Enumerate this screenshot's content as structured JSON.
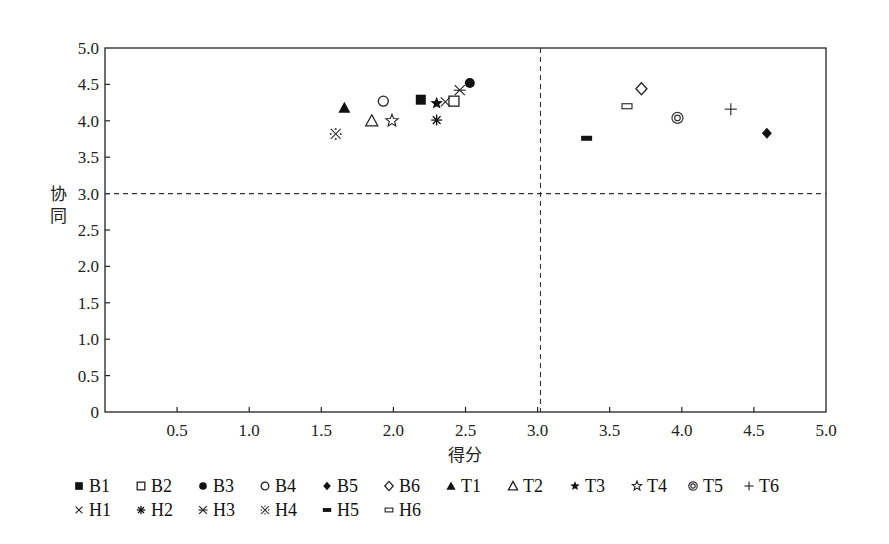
{
  "chart_data": {
    "type": "scatter",
    "title": "",
    "xlabel": "得分",
    "ylabel": "协同",
    "xlim": [
      0,
      5.0
    ],
    "ylim": [
      0,
      5.0
    ],
    "x_ticks": [
      "0.5",
      "1.0",
      "1.5",
      "2.0",
      "2.5",
      "3.0",
      "3.5",
      "4.0",
      "4.5",
      "5.0"
    ],
    "y_ticks": [
      "0",
      "0.5",
      "1.0",
      "1.5",
      "2.0",
      "2.5",
      "3.0",
      "3.5",
      "4.0",
      "4.5",
      "5.0"
    ],
    "grid": false,
    "reference_lines": [
      {
        "orientation": "vertical",
        "value": 3.02,
        "style": "dashed"
      },
      {
        "orientation": "horizontal",
        "value": 3.0,
        "style": "dashed"
      }
    ],
    "legend_position": "bottom",
    "series": [
      {
        "name": "B1",
        "marker": "filled-square",
        "x": 2.19,
        "y": 4.29
      },
      {
        "name": "B2",
        "marker": "open-square",
        "x": 2.42,
        "y": 4.27
      },
      {
        "name": "B3",
        "marker": "filled-circle",
        "x": 2.53,
        "y": 4.52
      },
      {
        "name": "B4",
        "marker": "open-circle",
        "x": 1.93,
        "y": 4.27
      },
      {
        "name": "B5",
        "marker": "filled-diamond",
        "x": 4.59,
        "y": 3.83
      },
      {
        "name": "B6",
        "marker": "open-diamond",
        "x": 3.72,
        "y": 4.44
      },
      {
        "name": "T1",
        "marker": "filled-triangle",
        "x": 1.66,
        "y": 4.18
      },
      {
        "name": "T2",
        "marker": "open-triangle",
        "x": 1.85,
        "y": 4.0
      },
      {
        "name": "T3",
        "marker": "filled-star",
        "x": 2.3,
        "y": 4.24
      },
      {
        "name": "T4",
        "marker": "open-star",
        "x": 1.99,
        "y": 4.0
      },
      {
        "name": "T5",
        "marker": "bullseye",
        "x": 3.97,
        "y": 4.04
      },
      {
        "name": "T6",
        "marker": "plus",
        "x": 4.34,
        "y": 4.16
      },
      {
        "name": "H1",
        "marker": "x-cross",
        "x": 2.36,
        "y": 4.26
      },
      {
        "name": "H2",
        "marker": "asterisk",
        "x": 2.3,
        "y": 4.01
      },
      {
        "name": "H3",
        "marker": "x-bar",
        "x": 2.46,
        "y": 4.42
      },
      {
        "name": "H4",
        "marker": "reference-mark",
        "x": 1.6,
        "y": 3.82
      },
      {
        "name": "H5",
        "marker": "filled-bar",
        "x": 3.34,
        "y": 3.76
      },
      {
        "name": "H6",
        "marker": "open-bar",
        "x": 3.62,
        "y": 4.2
      }
    ]
  },
  "legend": {
    "rows": [
      [
        "B1",
        "B2",
        "B3",
        "B4",
        "B5",
        "B6",
        "T1",
        "T2",
        "T3",
        "T4",
        "T5",
        "T6"
      ],
      [
        "H1",
        "H2",
        "H3",
        "H4",
        "H5",
        "H6"
      ]
    ]
  }
}
